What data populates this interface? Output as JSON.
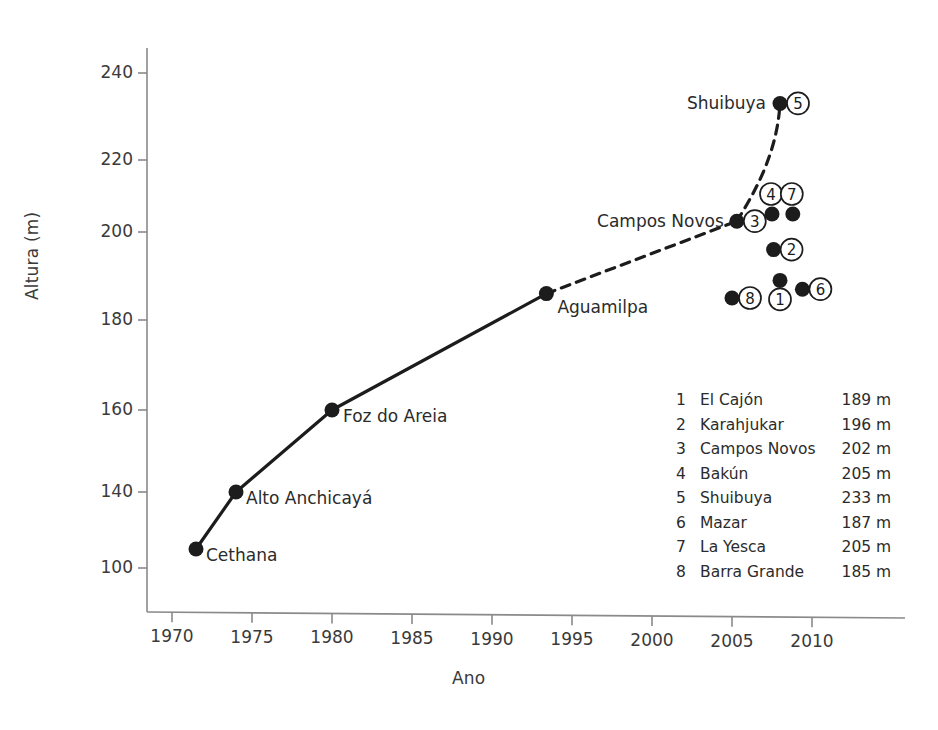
{
  "chart_data": {
    "type": "scatter",
    "title": "",
    "xlabel": "Ano",
    "ylabel": "Altura (m)",
    "xlim": [
      1968.3,
      2012.8
    ],
    "ylim": [
      93,
      248
    ],
    "xticks": [
      1970,
      1975,
      1980,
      1985,
      1990,
      1995,
      2000,
      2005,
      2010
    ],
    "yticks": [
      240,
      220,
      200,
      180,
      160,
      140,
      100
    ],
    "grid": false,
    "legend_position": "inside-lower-right",
    "series": [
      {
        "name": "Recordes historicos (linha solida)",
        "line_style": "solid",
        "points": [
          {
            "label": "Cethana",
            "x": 1971.5,
            "y": 110,
            "label_side": "right"
          },
          {
            "label": "Alto Anchicaya",
            "x": 1974.0,
            "y": 140,
            "label_side": "right"
          },
          {
            "label": "Foz do Areia",
            "x": 1980.0,
            "y": 160,
            "label_side": "right"
          },
          {
            "label": "Aguamilpa",
            "x": 1993.4,
            "y": 186,
            "label_side": "right"
          }
        ]
      },
      {
        "name": "Tendencia projetada (linha tracejada)",
        "line_style": "dashed",
        "points": [
          {
            "label": "Aguamilpa",
            "x": 1993.4,
            "y": 186,
            "label_side": "right"
          },
          {
            "label": "Campos Novos",
            "x": 2005.3,
            "y": 203,
            "label_side": "left"
          },
          {
            "label": "Shuibuya",
            "x": 2008.0,
            "y": 233,
            "label_side": "left"
          }
        ]
      }
    ],
    "numbered_points": [
      {
        "num": "1",
        "name": "El Cajon",
        "display_name": "El Cajón",
        "height_m": 189,
        "height_label": "189 m",
        "x": 2008.0,
        "y": 189,
        "badge_side": "below"
      },
      {
        "num": "2",
        "name": "Karahjukar",
        "display_name": "Karahjukar",
        "height_m": 196,
        "height_label": "196 m",
        "x": 2007.6,
        "y": 196,
        "badge_side": "right"
      },
      {
        "num": "3",
        "name": "Campos Novos",
        "display_name": "Campos Novos",
        "height_m": 202,
        "height_label": "202 m",
        "x": 2005.3,
        "y": 203,
        "badge_side": "right"
      },
      {
        "num": "4",
        "name": "Bakun",
        "display_name": "Bakún",
        "height_m": 205,
        "height_label": "205 m",
        "x": 2007.5,
        "y": 205,
        "badge_side": "above"
      },
      {
        "num": "5",
        "name": "Shuibuya",
        "display_name": "Shuibuya",
        "height_m": 233,
        "height_label": "233 m",
        "x": 2008.0,
        "y": 233,
        "badge_side": "right"
      },
      {
        "num": "6",
        "name": "Mazar",
        "display_name": "Mazar",
        "height_m": 187,
        "height_label": "187 m",
        "x": 2009.4,
        "y": 187,
        "badge_side": "right"
      },
      {
        "num": "7",
        "name": "La Yesca",
        "display_name": "La Yesca",
        "height_m": 205,
        "height_label": "205 m",
        "x": 2008.8,
        "y": 205,
        "badge_side": "above"
      },
      {
        "num": "8",
        "name": "Barra Grande",
        "display_name": "Barra Grande",
        "height_m": 185,
        "height_label": "185 m",
        "x": 2005.0,
        "y": 185,
        "badge_side": "right"
      }
    ]
  },
  "axes": {
    "ylabel": "Altura (m)",
    "xlabel": "Ano",
    "ytick_labels": [
      "240",
      "220",
      "200",
      "180",
      "160",
      "140",
      "100"
    ],
    "xtick_labels": [
      "1970",
      "1975",
      "1980",
      "1985",
      "1990",
      "1995",
      "2000",
      "2005",
      "2010"
    ]
  },
  "point_labels": {
    "cethana": "Cethana",
    "alto_anchicaya": "Alto Anchicayá",
    "foz_do_areia": "Foz do Areia",
    "aguamilpa": "Aguamilpa",
    "campos_novos": "Campos Novos",
    "shuibuya": "Shuibuya"
  },
  "legend": {
    "rows": [
      {
        "num": "1",
        "name": "El Cajón",
        "value": "189 m"
      },
      {
        "num": "2",
        "name": "Karahjukar",
        "value": "196 m"
      },
      {
        "num": "3",
        "name": "Campos Novos",
        "value": "202 m"
      },
      {
        "num": "4",
        "name": "Bakún",
        "value": "205 m"
      },
      {
        "num": "5",
        "name": "Shuibuya",
        "value": "233 m"
      },
      {
        "num": "6",
        "name": "Mazar",
        "value": "187 m"
      },
      {
        "num": "7",
        "name": "La Yesca",
        "value": "205 m"
      },
      {
        "num": "8",
        "name": "Barra Grande",
        "value": "185 m"
      }
    ]
  },
  "colors": {
    "ink": "#2b2b2b",
    "axis": "#8a8a8a",
    "marker": "#1c1c1c",
    "background": "#ffffff"
  }
}
